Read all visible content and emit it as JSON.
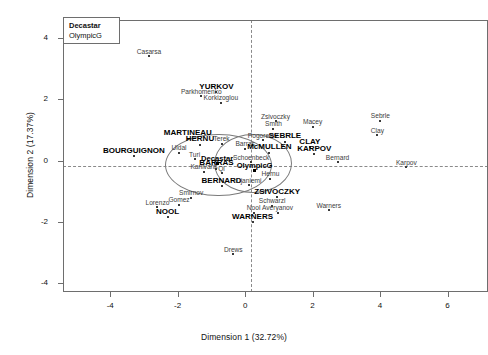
{
  "chart_data": {
    "type": "scatter",
    "title": "",
    "xlabel": "Dimension 1 (32.72%)",
    "ylabel": "Dimension 2 (17.37%)",
    "xlim": [
      -5.4,
      7.2
    ],
    "ylim": [
      -4.3,
      4.6
    ],
    "xticks": [
      -4,
      -2,
      0,
      2,
      4,
      6
    ],
    "yticks": [
      -4,
      -2,
      0,
      2,
      4
    ],
    "grid": false,
    "reference_lines": {
      "vertical_x": 0,
      "horizontal_y": 0,
      "style": "dashed"
    },
    "legend": {
      "position": "top-left",
      "entries": [
        "Decastar",
        "OlympicG"
      ]
    },
    "ellipses": [
      {
        "name": "Decastar",
        "cx": -0.82,
        "cy": -0.12,
        "rx": 1.55,
        "ry": 0.99
      },
      {
        "name": "OlympicG",
        "cx": 0.2,
        "cy": -0.05,
        "rx": 1.12,
        "ry": 0.93
      }
    ],
    "group_centroids": [
      {
        "label": "Decastar",
        "x": -0.83,
        "y": -0.09
      },
      {
        "label": "OlympicG",
        "x": 0.28,
        "y": -0.34
      }
    ],
    "points": [
      {
        "label": "Casarsa",
        "x": -2.85,
        "y": 3.41,
        "style": "individual"
      },
      {
        "label": "Parkhomenko",
        "x": -1.3,
        "y": 2.1,
        "style": "individual"
      },
      {
        "label": "YURKOV",
        "x": -0.85,
        "y": 2.23,
        "style": "group"
      },
      {
        "label": "Korkizoglou",
        "x": -0.72,
        "y": 1.9,
        "style": "individual"
      },
      {
        "label": "Zsivoczky",
        "x": 0.9,
        "y": 1.28,
        "style": "individual"
      },
      {
        "label": "Smith",
        "x": 0.84,
        "y": 1.04,
        "style": "individual"
      },
      {
        "label": "Macey",
        "x": 2.0,
        "y": 1.1,
        "style": "individual"
      },
      {
        "label": "Sebrle",
        "x": 4.01,
        "y": 1.31,
        "style": "individual"
      },
      {
        "label": "Clay",
        "x": 3.92,
        "y": 0.83,
        "style": "individual"
      },
      {
        "label": "MARTINEAU",
        "x": -1.7,
        "y": 0.72,
        "style": "group"
      },
      {
        "label": "HERNU",
        "x": -1.34,
        "y": 0.52,
        "style": "group"
      },
      {
        "label": "Terek",
        "x": -0.7,
        "y": 0.55,
        "style": "individual"
      },
      {
        "label": "Pogorelov",
        "x": 0.52,
        "y": 0.66,
        "style": "individual"
      },
      {
        "label": "SEBRLE",
        "x": 1.18,
        "y": 0.62,
        "style": "group"
      },
      {
        "label": "CLAY",
        "x": 1.92,
        "y": 0.44,
        "style": "group"
      },
      {
        "label": "Barras",
        "x": 0.0,
        "y": 0.38,
        "style": "individual"
      },
      {
        "label": "McMULLEN",
        "x": 0.72,
        "y": 0.26,
        "style": "group"
      },
      {
        "label": "KARPOV",
        "x": 2.05,
        "y": 0.2,
        "style": "group"
      },
      {
        "label": "BOURGUIGNON",
        "x": -3.3,
        "y": 0.14,
        "style": "group"
      },
      {
        "label": "Uldal",
        "x": -1.96,
        "y": 0.25,
        "style": "individual"
      },
      {
        "label": "Turi",
        "x": -1.5,
        "y": 0.05,
        "style": "individual"
      },
      {
        "label": "Decastar",
        "x": -0.83,
        "y": -0.09,
        "style": "centroid"
      },
      {
        "label": "Schoenbeck",
        "x": 0.18,
        "y": -0.05,
        "style": "individual"
      },
      {
        "label": "Bernard",
        "x": 2.74,
        "y": -0.05,
        "style": "individual"
      },
      {
        "label": "Karpov",
        "x": 4.78,
        "y": -0.22,
        "style": "individual"
      },
      {
        "label": "Karlivans",
        "x": -1.22,
        "y": -0.36,
        "style": "individual"
      },
      {
        "label": "BARRAS",
        "x": -0.85,
        "y": -0.26,
        "style": "group"
      },
      {
        "label": "Qi",
        "x": -0.7,
        "y": -0.42,
        "style": "individual"
      },
      {
        "label": "OlympicG",
        "x": 0.28,
        "y": -0.34,
        "style": "centroid"
      },
      {
        "label": "Hernu",
        "x": 0.75,
        "y": -0.6,
        "style": "individual"
      },
      {
        "label": "BERNARD",
        "x": -0.7,
        "y": -0.84,
        "style": "group"
      },
      {
        "label": "Ojaniemi",
        "x": 0.1,
        "y": -0.8,
        "style": "individual"
      },
      {
        "label": "Smirnov",
        "x": -1.6,
        "y": -1.22,
        "style": "individual"
      },
      {
        "label": "Lorenzo",
        "x": -2.6,
        "y": -1.52,
        "style": "individual"
      },
      {
        "label": "Gomez",
        "x": -1.96,
        "y": -1.44,
        "style": "individual"
      },
      {
        "label": "ZSIVOCZKY",
        "x": 0.95,
        "y": -1.2,
        "style": "group"
      },
      {
        "label": "Schwarzl",
        "x": 0.8,
        "y": -1.48,
        "style": "individual"
      },
      {
        "label": "NOOL",
        "x": -2.3,
        "y": -1.86,
        "style": "group"
      },
      {
        "label": "Nool",
        "x": 0.25,
        "y": -1.7,
        "style": "individual"
      },
      {
        "label": "Averyanov",
        "x": 0.96,
        "y": -1.7,
        "style": "individual"
      },
      {
        "label": "Warners",
        "x": 2.48,
        "y": -1.62,
        "style": "individual"
      },
      {
        "label": "WARNERS",
        "x": 0.22,
        "y": -2.02,
        "style": "group"
      },
      {
        "label": "Drews",
        "x": -0.35,
        "y": -3.06,
        "style": "individual"
      }
    ]
  },
  "legend": {
    "row_decastar": "Decastar",
    "row_olympicg": "OlympicG"
  },
  "axes": {
    "x_title": "Dimension 1 (32.72%)",
    "y_title": "Dimension 2 (17.37%)",
    "x_ticks": [
      "-4",
      "-2",
      "0",
      "2",
      "4",
      "6"
    ],
    "y_ticks": [
      "4",
      "2",
      "0",
      "-2",
      "-4"
    ]
  }
}
